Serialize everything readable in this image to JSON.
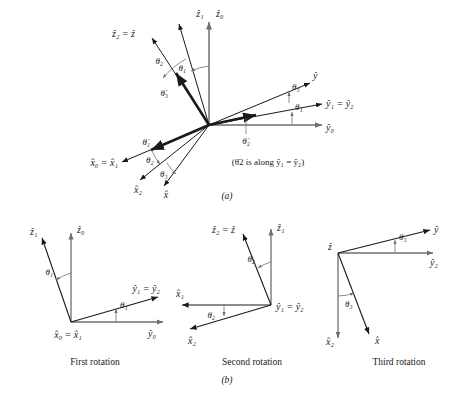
{
  "figure": {
    "panel_a_label": "(a)",
    "panel_b_label": "(b)",
    "note_a": "(θ̇2 is along ŷ₁ = ŷ₂)"
  },
  "panel_a": {
    "axes": [
      {
        "name": "z0",
        "label": "ẑ₀"
      },
      {
        "name": "z1",
        "label": "ẑ₁"
      },
      {
        "name": "z2_eq_z",
        "label": "ẑ₂ = ẑ"
      },
      {
        "name": "y",
        "label": "ŷ"
      },
      {
        "name": "y1_eq_y2",
        "label": "ŷ₁ = ŷ₂"
      },
      {
        "name": "y0",
        "label": "ŷ₀"
      },
      {
        "name": "x0_eq_x1",
        "label": "x̂₀ = x̂₁"
      },
      {
        "name": "x2",
        "label": "x̂₂"
      },
      {
        "name": "x",
        "label": "x̂"
      }
    ],
    "angles": [
      {
        "name": "theta1-top",
        "label": "θ₁"
      },
      {
        "name": "theta2-top",
        "label": "θ₂"
      },
      {
        "name": "theta3-right",
        "label": "θ₃"
      },
      {
        "name": "theta1-right",
        "label": "θ₁"
      },
      {
        "name": "theta2-bottom",
        "label": "θ₂"
      },
      {
        "name": "theta3-bottom",
        "label": "θ₃"
      }
    ],
    "rates": [
      {
        "name": "theta1-dot",
        "label": "θ̇₁"
      },
      {
        "name": "theta2-dot",
        "label": "θ̇₂"
      },
      {
        "name": "theta3-dot",
        "label": "θ̇₃"
      }
    ]
  },
  "panel_b": {
    "first": {
      "caption": "First rotation",
      "labels": {
        "z1": "ẑ₁",
        "z0": "ẑ₀",
        "theta_top": "θ₁",
        "y1_eq_y2": "ŷ₁ = ŷ₂",
        "theta_bottom": "θ₁",
        "x0_eq_x1": "x̂₀ = x̂₁",
        "y0": "ŷ₀"
      }
    },
    "second": {
      "caption": "Second rotation",
      "labels": {
        "z2_eq_z": "ẑ₂ = ẑ",
        "z1": "ẑ₁",
        "theta_top": "θ₂",
        "x1": "x̂₁",
        "theta_bottom": "θ₂",
        "y1_eq_y2": "ŷ₁ = ŷ₂",
        "x2": "x̂₂"
      }
    },
    "third": {
      "caption": "Third rotation",
      "labels": {
        "z": "ẑ",
        "y": "ŷ",
        "theta_top": "θ₃",
        "y2": "ŷ₂",
        "theta_bottom": "θ₃",
        "x2": "x̂₂",
        "x": "x̂"
      }
    }
  },
  "style": {
    "line_color": "#1a1a1a",
    "thin_color": "#6e6e6e",
    "background": "#ffffff"
  }
}
